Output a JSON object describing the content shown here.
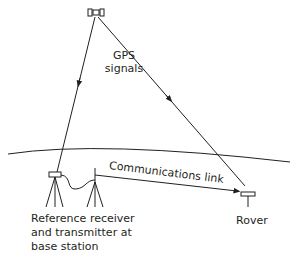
{
  "diagram": {
    "type": "RTK GPS setup",
    "labels": {
      "gps_signals": [
        "GPS",
        "signals"
      ],
      "communications_link": "Communications link",
      "rover": "Rover",
      "reference": [
        "Reference receiver",
        "and transmitter at",
        "base station"
      ]
    },
    "nodes": [
      {
        "id": "satellite",
        "icon": "satellite-icon"
      },
      {
        "id": "reference-receiver",
        "icon": "tripod-receiver-icon"
      },
      {
        "id": "transmitter",
        "icon": "tripod-antenna-icon"
      },
      {
        "id": "rover",
        "icon": "rover-antenna-icon"
      }
    ],
    "edges": [
      {
        "from": "satellite",
        "to": "reference-receiver",
        "label": "GPS signals"
      },
      {
        "from": "satellite",
        "to": "rover",
        "label": "GPS signals"
      },
      {
        "from": "transmitter",
        "to": "rover",
        "label": "Communications link"
      },
      {
        "from": "reference-receiver",
        "to": "transmitter",
        "label": "cable"
      }
    ],
    "colors": {
      "line": "#231f20",
      "background": "#ffffff"
    }
  }
}
